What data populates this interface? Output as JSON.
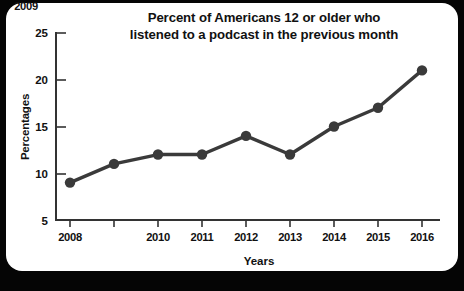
{
  "chart_data": {
    "type": "line",
    "title": "Percent of Americans 12 or older who listened to a podcast in the previous month",
    "title_lines": [
      "Percent of Americans 12 or older who",
      "listened to a podcast in the previous month"
    ],
    "xlabel": "Years",
    "ylabel": "Percentages",
    "categories": [
      "2008",
      "2009",
      "2010",
      "2011",
      "2012",
      "2013",
      "2014",
      "2015",
      "2016"
    ],
    "values": [
      9,
      11,
      12,
      12,
      14,
      12,
      15,
      17,
      21
    ],
    "series": [
      {
        "name": "Percent listened to a podcast in previous month",
        "values": [
          9,
          11,
          12,
          12,
          14,
          12,
          15,
          17,
          21
        ]
      }
    ],
    "ylim": [
      5,
      25
    ],
    "yticks": [
      5,
      10,
      15,
      20,
      25
    ],
    "ytick_labels": [
      "5",
      "10",
      "15",
      "20",
      "25"
    ],
    "xlim": [
      "2008",
      "2016"
    ],
    "grid": false,
    "legend": false,
    "legend_position": "none",
    "marker": "circle",
    "line_color": "#3a3a3a",
    "marker_color": "#3a3a3a",
    "axis_color": "#333333",
    "background_color": "#ffffff",
    "outer_background_color": "#050505"
  }
}
